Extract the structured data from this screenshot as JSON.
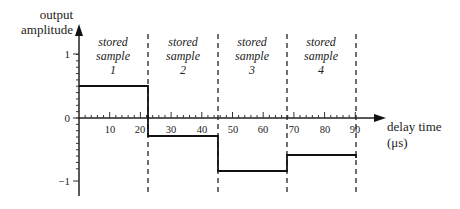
{
  "chart_data": {
    "type": "line",
    "subtype": "step",
    "title": "",
    "xlabel": "delay time",
    "xlabel_unit": "(μs)",
    "ylabel_line1": "output",
    "ylabel_line2": "amplitude",
    "xlim": [
      0,
      95
    ],
    "ylim": [
      -1.25,
      1.4
    ],
    "x_ticks": [
      10,
      20,
      30,
      40,
      50,
      60,
      70,
      80,
      90
    ],
    "x_tick_labels": [
      "10",
      "20",
      "30",
      "40",
      "50",
      "60",
      "70",
      "80",
      "90"
    ],
    "y_ticks": [
      1,
      0,
      -1
    ],
    "y_tick_labels": [
      "1",
      "0",
      "−1"
    ],
    "grid": false,
    "segments": [
      {
        "label": "stored sample 1",
        "x_start": 0,
        "x_end": 22.5,
        "value": 0.5
      },
      {
        "label": "stored sample 2",
        "x_start": 22.5,
        "x_end": 45,
        "value": -0.3
      },
      {
        "label": "stored sample 3",
        "x_start": 45,
        "x_end": 67.5,
        "value": -0.83
      },
      {
        "label": "stored sample 4",
        "x_start": 67.5,
        "x_end": 90,
        "value": -0.6
      }
    ],
    "boundaries": [
      22.5,
      45,
      67.5,
      90
    ],
    "annotations": [
      {
        "line1": "stored",
        "line2": "sample",
        "line3": "1"
      },
      {
        "line1": "stored",
        "line2": "sample",
        "line3": "2"
      },
      {
        "line1": "stored",
        "line2": "sample",
        "line3": "3"
      },
      {
        "line1": "stored",
        "line2": "sample",
        "line3": "4"
      }
    ]
  }
}
